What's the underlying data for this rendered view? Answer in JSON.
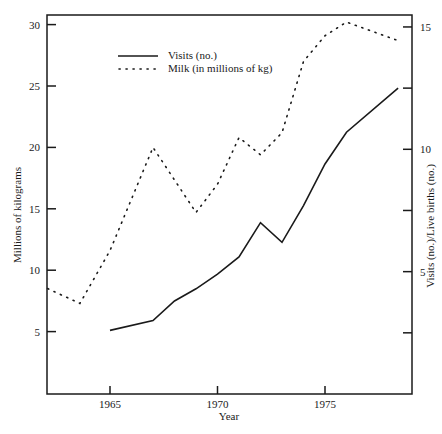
{
  "chart_data": {
    "type": "line",
    "title": "",
    "xlabel": "Year",
    "ylabel_left": "Millions of kilograms",
    "ylabel_right": "Visits (no.)/Live births (no.)",
    "xlim": [
      1962.1,
      1978.4
    ],
    "ylim_left": [
      0,
      31
    ],
    "ylim_right": [
      0,
      15.5
    ],
    "x_ticks": [
      1965,
      1970,
      1975
    ],
    "y_ticks_left": [
      5,
      10,
      15,
      20,
      25,
      30
    ],
    "y_ticks_right_labeled": [
      5,
      10,
      15
    ],
    "y_ticks_right_all": [
      2.5,
      5,
      7.5,
      10,
      12.5,
      15
    ],
    "grid": false,
    "legend_position": "upper-left-inside",
    "series": [
      {
        "name": "Visits (no.)",
        "axis": "right",
        "style": "solid",
        "x": [
          1965,
          1967,
          1968,
          1969,
          1970,
          1971,
          1972,
          1973,
          1974,
          1975,
          1976,
          1978.4
        ],
        "values": [
          2.6,
          3.0,
          3.8,
          4.3,
          4.9,
          5.6,
          7.0,
          6.2,
          7.7,
          9.4,
          10.7,
          12.5
        ]
      },
      {
        "name": "Milk (in millions of kg)",
        "axis": "left",
        "style": "dotted",
        "x": [
          1962.1,
          1963.6,
          1965,
          1967,
          1969,
          1970,
          1971,
          1972,
          1973,
          1974,
          1975,
          1976,
          1978.4
        ],
        "values": [
          8.5,
          7.3,
          11.6,
          20.0,
          14.7,
          17.0,
          20.8,
          19.4,
          21.2,
          27.0,
          29.1,
          30.2,
          28.7
        ]
      }
    ]
  },
  "labels": {
    "xlabel": "Year",
    "ylabel_left": "Millions of kilograms",
    "ylabel_right": "Visits (no.)/Live births (no.)",
    "legend_visits": "Visits (no.)",
    "legend_milk": "Milk (in millions of kg)"
  }
}
